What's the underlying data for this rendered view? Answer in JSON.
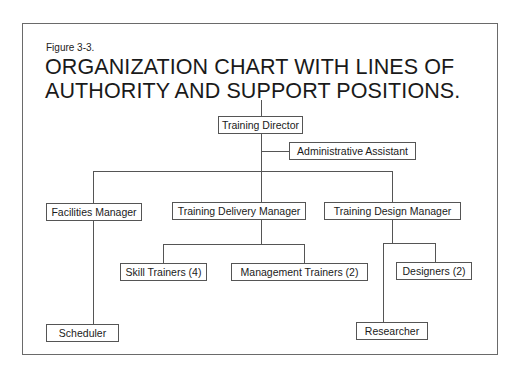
{
  "figure": {
    "label": "Figure 3-3.",
    "title_line1": "ORGANIZATION CHART WITH LINES OF",
    "title_line2": "AUTHORITY AND SUPPORT POSITIONS."
  },
  "nodes": {
    "training_director": "Training Director",
    "administrative_assistant": "Administrative Assistant",
    "facilities_manager": "Facilities Manager",
    "training_delivery_manager": "Training Delivery Manager",
    "training_design_manager": "Training Design Manager",
    "skill_trainers": "Skill Trainers (4)",
    "management_trainers": "Management Trainers (2)",
    "designers": "Designers (2)",
    "scheduler": "Scheduler",
    "researcher": "Researcher"
  },
  "hierarchy": {
    "Training Director": {
      "support": [
        "Administrative Assistant"
      ],
      "reports": {
        "Facilities Manager": [
          "Scheduler"
        ],
        "Training Delivery Manager": [
          "Skill Trainers (4)",
          "Management Trainers (2)"
        ],
        "Training Design Manager": [
          "Designers (2)",
          "Researcher"
        ]
      }
    }
  }
}
